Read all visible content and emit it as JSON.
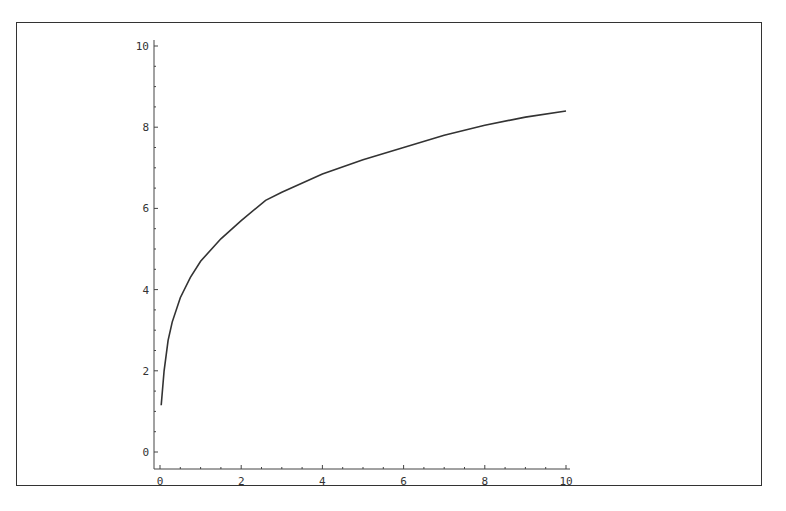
{
  "chart_data": {
    "type": "line",
    "title": "",
    "xlabel": "",
    "ylabel": "",
    "xlim": [
      0,
      10
    ],
    "ylim": [
      0,
      10
    ],
    "grid": false,
    "legend": null,
    "x_ticks": [
      0,
      2,
      4,
      6,
      8,
      10
    ],
    "y_ticks": [
      0,
      2,
      4,
      6,
      8,
      10
    ],
    "series": [
      {
        "name": "curve",
        "color": "#333333",
        "x": [
          0.03,
          0.1,
          0.2,
          0.3,
          0.5,
          0.75,
          1.0,
          1.5,
          2.0,
          2.6,
          3.0,
          4.0,
          5.0,
          6.0,
          7.0,
          8.0,
          9.0,
          10.0
        ],
        "y": [
          1.15,
          2.0,
          2.75,
          3.2,
          3.8,
          4.3,
          4.7,
          5.25,
          5.7,
          6.2,
          6.4,
          6.85,
          7.2,
          7.5,
          7.8,
          8.05,
          8.25,
          8.4
        ]
      }
    ]
  }
}
